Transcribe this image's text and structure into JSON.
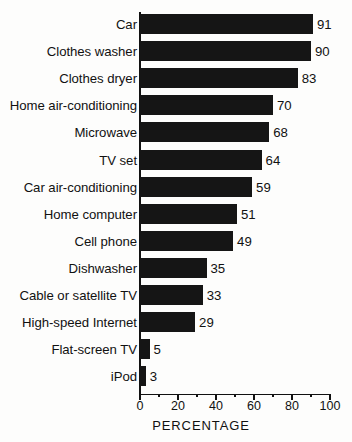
{
  "chart_data": {
    "type": "bar",
    "orientation": "horizontal",
    "title": "",
    "subtitle": "",
    "xlabel": "PERCENTAGE",
    "ylabel": "",
    "xlim": [
      0,
      100
    ],
    "xticks": [
      0,
      20,
      40,
      60,
      80,
      100
    ],
    "xtick_labels": [
      "0",
      "20",
      "40",
      "60",
      "80",
      "100"
    ],
    "minor_tick_interval": 10,
    "grid": false,
    "legend": false,
    "bar_color": "#151515",
    "background_color": "#fdfdfc",
    "value_labels_shown": true,
    "categories": [
      "Car",
      "Clothes washer",
      "Clothes dryer",
      "Home air-conditioning",
      "Microwave",
      "TV set",
      "Car air-conditioning",
      "Home computer",
      "Cell phone",
      "Dishwasher",
      "Cable or satellite TV",
      "High-speed Internet",
      "Flat-screen TV",
      "iPod"
    ],
    "values": [
      91,
      90,
      83,
      70,
      68,
      64,
      59,
      51,
      49,
      35,
      33,
      29,
      5,
      3
    ],
    "value_label_texts": [
      "91",
      "90",
      "83",
      "70",
      "68",
      "64",
      "59",
      "51",
      "49",
      "35",
      "33",
      "29",
      "5",
      "3"
    ]
  }
}
